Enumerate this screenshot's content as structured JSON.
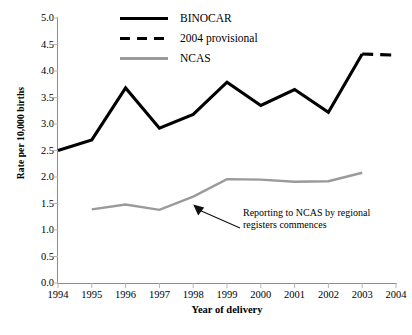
{
  "chart_data": {
    "type": "line",
    "title": "",
    "xlabel": "Year of delivery",
    "ylabel": "Rate per 10,000 births",
    "x": [
      1994,
      1995,
      1996,
      1997,
      1998,
      1999,
      2000,
      2001,
      2002,
      2003,
      2004
    ],
    "xticklabels": [
      "1994",
      "1995",
      "1996",
      "1997",
      "1998",
      "1999",
      "2000",
      "2001",
      "2002",
      "2003",
      "2004"
    ],
    "yticklabels": [
      "5.0",
      "4.5",
      "4.0",
      "3.5",
      "3.0",
      "2.5",
      "2.0",
      "1.5",
      "1.0",
      "0.5",
      "0.0"
    ],
    "yticks": [
      5.0,
      4.5,
      4.0,
      3.5,
      3.0,
      2.5,
      2.0,
      1.5,
      1.0,
      0.5,
      0.0
    ],
    "ylim": [
      0.0,
      5.0
    ],
    "xlim": [
      1994,
      2004
    ],
    "grid": false,
    "legend_position": "top-center",
    "series": [
      {
        "name": "BINOCAR",
        "style": "solid",
        "color": "#000000",
        "x": [
          1994,
          1995,
          1996,
          1997,
          1998,
          1999,
          2000,
          2001,
          2002,
          2003
        ],
        "values": [
          2.5,
          2.7,
          3.68,
          2.92,
          3.18,
          3.79,
          3.35,
          3.65,
          3.22,
          4.32
        ]
      },
      {
        "name": "2004 provisional",
        "style": "dashed",
        "color": "#000000",
        "x": [
          2003,
          2004
        ],
        "values": [
          4.32,
          4.3
        ]
      },
      {
        "name": "NCAS",
        "style": "solid",
        "color": "#9a9a9a",
        "x": [
          1995,
          1996,
          1997,
          1998,
          1999,
          2000,
          2001,
          2002,
          2003
        ],
        "values": [
          1.39,
          1.48,
          1.38,
          1.63,
          1.96,
          1.95,
          1.91,
          1.92,
          2.08
        ]
      }
    ],
    "annotations": [
      {
        "text_line1": "Reporting to NCAS by regional",
        "text_line2": "registers commences",
        "points_to_x": 1998,
        "points_to_y": 1.63
      }
    ]
  },
  "legend": {
    "items": [
      {
        "label": "BINOCAR",
        "key": "solid-black"
      },
      {
        "label": "2004 provisional",
        "key": "dashed-black"
      },
      {
        "label": "NCAS",
        "key": "solid-gray"
      }
    ]
  },
  "axes": {
    "y_title": "Rate per 10,000 births",
    "x_title": "Year of delivery"
  }
}
